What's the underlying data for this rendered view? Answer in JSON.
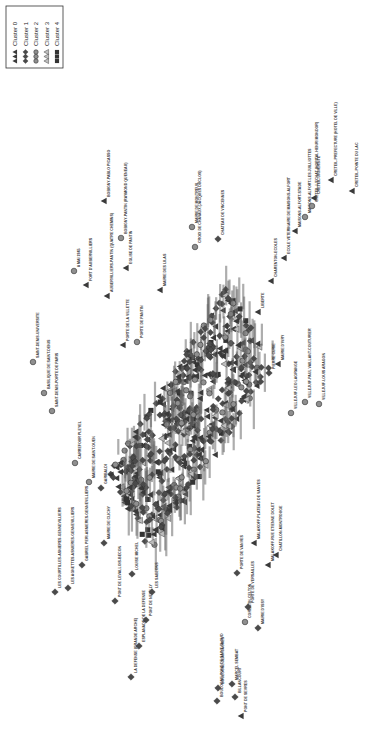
{
  "chart_data": {
    "type": "scatter",
    "title": "",
    "xlabel": "",
    "ylabel": "",
    "orientation": "rotated-90-clockwise",
    "grid": false,
    "legend_position": "top-left",
    "legend": [
      {
        "label": "Cluster 0",
        "marker": "triangle",
        "color": "#3a3a3a"
      },
      {
        "label": "Cluster 1",
        "marker": "diamond",
        "color": "#4a4a4a"
      },
      {
        "label": "Cluster 2",
        "marker": "circle",
        "color": "#8a8a8a"
      },
      {
        "label": "Cluster 3",
        "marker": "triangle-outline",
        "color": "#9a9a9a"
      },
      {
        "label": "Cluster 4",
        "marker": "square",
        "color": "#333333"
      }
    ],
    "points": [
      {
        "label": "SAINT-DENIS-UNIVERSITE",
        "cluster": 2,
        "x": 33,
        "y": 362
      },
      {
        "label": "BASILIQUE DE SAINT-DENIS",
        "cluster": 2,
        "x": 44,
        "y": 393
      },
      {
        "label": "SAINT-DENIS-PORTE DE PARIS",
        "cluster": 2,
        "x": 52,
        "y": 411
      },
      {
        "label": "CARREFOUR PLEYEL",
        "cluster": 2,
        "x": 75,
        "y": 463
      },
      {
        "label": "MAIRIE DE SAINT-OUEN",
        "cluster": 2,
        "x": 89,
        "y": 482
      },
      {
        "label": "GARIBALDI",
        "cluster": 1,
        "x": 101,
        "y": 488
      },
      {
        "label": "LES COURTILLES-ASNIERES-GENNEVILLIERS",
        "cluster": 1,
        "x": 55,
        "y": 592
      },
      {
        "label": "LES AGNETTES-ASNIERES-GENNEVILLIERS",
        "cluster": 1,
        "x": 68,
        "y": 588
      },
      {
        "label": "GABRIEL PERI-ASNIERES-GENNEVILLIERS",
        "cluster": 1,
        "x": 82,
        "y": 565
      },
      {
        "label": "MAIRIE DE CLICHY",
        "cluster": 1,
        "x": 104,
        "y": 543
      },
      {
        "label": "PONT DE LEVALLOIS-BECON",
        "cluster": 1,
        "x": 115,
        "y": 601
      },
      {
        "label": "LOUISE MICHEL",
        "cluster": 1,
        "x": 132,
        "y": 574
      },
      {
        "label": "PONT DE NEUILLY",
        "cluster": 1,
        "x": 146,
        "y": 620
      },
      {
        "label": "ESPLANADE DE LA DEFENSE",
        "cluster": 1,
        "x": 139,
        "y": 646
      },
      {
        "label": "LA DEFENSE (GRANDE ARCHE)",
        "cluster": 1,
        "x": 131,
        "y": 677
      },
      {
        "label": "LES SABLONS",
        "cluster": 1,
        "x": 152,
        "y": 592
      },
      {
        "label": "BOULOGNE-PONT DE SAINT-CLOUD",
        "cluster": 1,
        "x": 217,
        "y": 701
      },
      {
        "label": "BOULOGNE-JEAN JAURES",
        "cluster": 1,
        "x": 218,
        "y": 688
      },
      {
        "label": "PONT DE SEVRES",
        "cluster": 0,
        "x": 241,
        "y": 716
      },
      {
        "label": "BILLANCOURT",
        "cluster": 1,
        "x": 235,
        "y": 697
      },
      {
        "label": "MARCEL SEMBAT",
        "cluster": 1,
        "x": 232,
        "y": 684
      },
      {
        "label": "MAIRIE D'ISSY",
        "cluster": 1,
        "x": 258,
        "y": 628
      },
      {
        "label": "CORENTIN-CELTON",
        "cluster": 2,
        "x": 245,
        "y": 622
      },
      {
        "label": "PORTE DE VERSAILLES",
        "cluster": 1,
        "x": 248,
        "y": 607
      },
      {
        "label": "PORTE DE VANVES",
        "cluster": 1,
        "x": 237,
        "y": 573
      },
      {
        "label": "MALAKOFF-PLATEAU DE VANVES",
        "cluster": 0,
        "x": 254,
        "y": 543
      },
      {
        "label": "MALAKOFF-RUE ETIENNE DOLET",
        "cluster": 0,
        "x": 268,
        "y": 565
      },
      {
        "label": "CHATILLON-MONTROUGE",
        "cluster": 0,
        "x": 276,
        "y": 555
      },
      {
        "label": "VILLEJUIF-LEO LAGRANGE",
        "cluster": 2,
        "x": 291,
        "y": 413
      },
      {
        "label": "VILLEJUIF-PAUL VAILLANT-COUTURIER",
        "cluster": 2,
        "x": 305,
        "y": 402
      },
      {
        "label": "VILLEJUIF-LOUIS ARAGON",
        "cluster": 2,
        "x": 319,
        "y": 404
      },
      {
        "label": "MAIRIE D'IVRY",
        "cluster": 0,
        "x": 278,
        "y": 364
      },
      {
        "label": "PIERRE CURIE",
        "cluster": 1,
        "x": 269,
        "y": 373
      },
      {
        "label": "LIBERTE",
        "cluster": 0,
        "x": 258,
        "y": 312
      },
      {
        "label": "CHARENTON-ECOLES",
        "cluster": 0,
        "x": 271,
        "y": 281
      },
      {
        "label": "ECOLE VETERINAIRE DE MAISONS-ALFORT",
        "cluster": 0,
        "x": 284,
        "y": 258
      },
      {
        "label": "MAISONS-ALFORT-STADE",
        "cluster": 0,
        "x": 295,
        "y": 231
      },
      {
        "label": "MAISONS-ALFORT-LES JUILLIOTTES",
        "cluster": 2,
        "x": 305,
        "y": 217
      },
      {
        "label": "CRETEIL-L'ECHAT (HOPITAL HENRI MONDOR)",
        "cluster": 2,
        "x": 312,
        "y": 206
      },
      {
        "label": "CRETEIL-UNIVERSITE",
        "cluster": 0,
        "x": 314,
        "y": 198
      },
      {
        "label": "CRETEIL-PREFECTURE (HOTEL DE VILLE)",
        "cluster": 0,
        "x": 331,
        "y": 180
      },
      {
        "label": "CRETEIL-POINTE DU LAC",
        "cluster": 0,
        "x": 352,
        "y": 191
      },
      {
        "label": "CHATEAU DE VINCENNES",
        "cluster": 1,
        "x": 218,
        "y": 239
      },
      {
        "label": "MAIRIE DE MONTREUIL",
        "cluster": 2,
        "x": 192,
        "y": 227
      },
      {
        "label": "CROIX DE CHAVAUX (JACQUES DUCLOS)",
        "cluster": 2,
        "x": 195,
        "y": 247
      },
      {
        "label": "BOBIGNY-PABLO PICASSO",
        "cluster": 0,
        "x": 104,
        "y": 201
      },
      {
        "label": "BOBIGNY-PANTIN (RAYMOND QUENEAU)",
        "cluster": 2,
        "x": 121,
        "y": 238
      },
      {
        "label": "EGLISE DE PANTIN",
        "cluster": 0,
        "x": 126,
        "y": 268
      },
      {
        "label": "AUBERVILLIERS-PANTIN (QUATRE CHEMINS)",
        "cluster": 0,
        "x": 107,
        "y": 296
      },
      {
        "label": "8 MAI 1945",
        "cluster": 2,
        "x": 74,
        "y": 271
      },
      {
        "label": "FORT D'AUBERVILLIERS",
        "cluster": 0,
        "x": 86,
        "y": 285
      },
      {
        "label": "MAIRIE DES LILAS",
        "cluster": 0,
        "x": 160,
        "y": 290
      },
      {
        "label": "PORTE DE LA VILLETTE",
        "cluster": 0,
        "x": 123,
        "y": 345
      },
      {
        "label": "PORTE DE PANTIN",
        "cluster": 2,
        "x": 137,
        "y": 342
      }
    ],
    "cluster_counts_visible": {
      "Cluster 0": "many",
      "Cluster 1": "many",
      "Cluster 2": "many",
      "Cluster 3": "few",
      "Cluster 4": "few"
    }
  },
  "legend": {
    "items": [
      {
        "label": "Cluster 0"
      },
      {
        "label": "Cluster 1"
      },
      {
        "label": "Cluster 2"
      },
      {
        "label": "Cluster 3"
      },
      {
        "label": "Cluster 4"
      }
    ]
  }
}
